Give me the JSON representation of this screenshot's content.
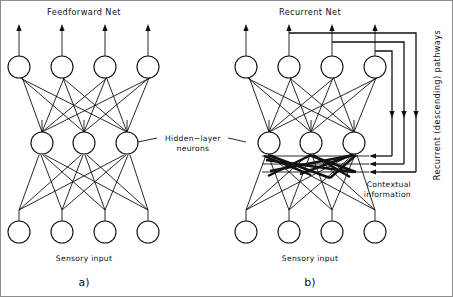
{
  "figure": {
    "panels": [
      {
        "id": "a",
        "panel_label": "a)",
        "title": "Feedforward  Net",
        "input_label": "Sensory  input",
        "layers": {
          "output": {
            "name": "output-layer",
            "count": 4
          },
          "hidden": {
            "name": "hidden-layer",
            "count": 3
          },
          "input": {
            "name": "input-layer",
            "count": 4
          }
        }
      },
      {
        "id": "b",
        "panel_label": "b)",
        "title": "Recurrent  Net",
        "input_label": "Sensory  input",
        "contextual_label_line1": "Contextual",
        "contextual_label_line2": "information",
        "recurrent_label": "Recurrent (descending) pathways",
        "recurrent_loop_count": 3,
        "layers": {
          "output": {
            "name": "output-layer",
            "count": 4
          },
          "hidden": {
            "name": "hidden-layer",
            "count": 3
          },
          "input": {
            "name": "input-layer",
            "count": 4
          }
        }
      }
    ],
    "shared_annotation": {
      "hidden_label_line1": "Hidden−layer",
      "hidden_label_line2": "neurons"
    },
    "colors": {
      "ink": "#111111",
      "paper": "#ffffff",
      "frame": "#8d8d8d"
    }
  }
}
